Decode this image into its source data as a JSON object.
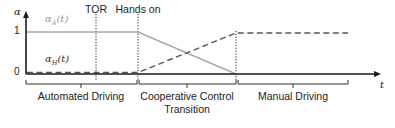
{
  "diagram": {
    "axes": {
      "y_label": "α",
      "x_label": "t",
      "y_ticks": [
        {
          "label": "1",
          "value": 1
        },
        {
          "label": "0",
          "value": 0
        }
      ]
    },
    "events": [
      {
        "label": "TOR",
        "line_style": "dotted"
      },
      {
        "label": "Hands on",
        "line_style": "dotted"
      }
    ],
    "curves": [
      {
        "label_base": "α",
        "label_sub": "A",
        "label_arg": "(t)",
        "style": "solid",
        "color": "#a8a8a8",
        "description": "stays at 1 until Hands on, then decreases linearly to 0 at end of transition"
      },
      {
        "label_base": "α",
        "label_sub": "H",
        "label_arg": "(t)",
        "style": "dashed",
        "color": "#555555",
        "description": "stays at 0 until Hands on, then increases linearly to 1 at end of transition, then stays at 1"
      }
    ],
    "phases": [
      {
        "label": "Automated Driving"
      },
      {
        "label_line1": "Cooperative Control",
        "label_line2": "Transition"
      },
      {
        "label": "Manual Driving"
      }
    ],
    "colors": {
      "axis": "#1a1a1a",
      "alpha_a": "#a8a8a8",
      "alpha_h": "#555555",
      "label_a": "#9a9a9a",
      "text": "#222222"
    }
  }
}
